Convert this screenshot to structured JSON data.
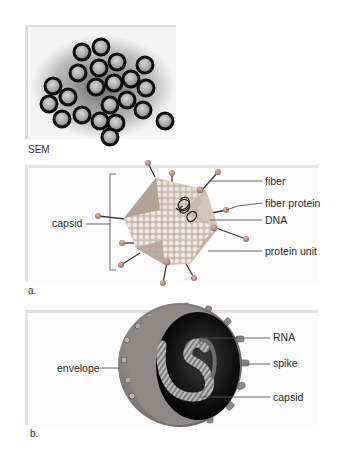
{
  "figure": {
    "sem_panel": {
      "caption": "SEM",
      "description": "micrograph of clustered spherical virus particles"
    },
    "panel_a": {
      "caption": "a.",
      "subject": "icosahedral (adenovirus-like) virus",
      "labels": {
        "left": [
          "capsid"
        ],
        "right": [
          "fiber",
          "fiber protein",
          "DNA",
          "protein unit"
        ]
      }
    },
    "panel_b": {
      "caption": "b.",
      "subject": "enveloped virus cutaway",
      "labels": {
        "left": [
          "envelope"
        ],
        "right": [
          "RNA",
          "spike",
          "capsid"
        ]
      }
    }
  },
  "colors": {
    "panel_bg": "#fbfbfb",
    "panel_edge": "#e4e4e4",
    "label_text": "#2b2b2b",
    "leader_line": "#555555",
    "capsid_face_dark": "#b9a89c",
    "capsid_face_light": "#e6ddd3",
    "fiber_knob": "#b98a82",
    "envelope": "#8c8581",
    "interior": "#111111"
  }
}
